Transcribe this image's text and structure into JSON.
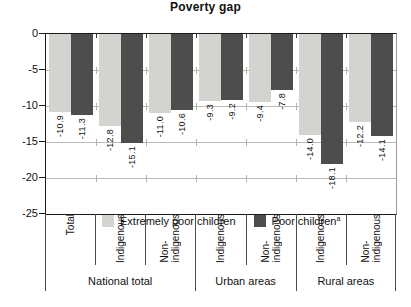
{
  "title": "Poverty gap",
  "legend": {
    "items": [
      {
        "label": "Extremely poor children",
        "superscript": "",
        "color": "#d3d3d0"
      },
      {
        "label": "Poor children",
        "superscript": "a",
        "color": "#4d4d4d"
      }
    ]
  },
  "y_axis": {
    "tick_labels": [
      "0",
      "-5",
      "-10",
      "-15",
      "-20",
      "-25"
    ]
  },
  "x_axis": {
    "groups": [
      {
        "label": "National total",
        "categories": [
          "Total",
          "Indigenous",
          "Non-\nindigenous"
        ]
      },
      {
        "label": "Urban areas",
        "categories": [
          "Indigenous",
          "Non-\nindigenous"
        ]
      },
      {
        "label": "Rural areas",
        "categories": [
          "Indigenous",
          "Non-\nindigenous"
        ]
      }
    ]
  },
  "chart_data": {
    "type": "bar",
    "title": "Poverty gap",
    "categories": [
      "National total - Total",
      "National total - Indigenous",
      "National total - Non-indigenous",
      "Urban areas - Indigenous",
      "Urban areas - Non-indigenous",
      "Rural areas - Indigenous",
      "Rural areas - Non-indigenous"
    ],
    "series": [
      {
        "name": "Extremely poor children",
        "color": "#d3d3d0",
        "values": [
          -10.9,
          -12.8,
          -11.0,
          -9.3,
          -9.4,
          -14.0,
          -12.2
        ],
        "labels": [
          "-10.9",
          "-12.8",
          "-11.0",
          "-9.3",
          "-9.4",
          "-14.0",
          "-12.2"
        ]
      },
      {
        "name": "Poor children",
        "color": "#4d4d4d",
        "values": [
          -11.3,
          -15.1,
          -10.6,
          -9.2,
          -7.8,
          -18.1,
          -14.1
        ],
        "labels": [
          "-11.3",
          "-15.1",
          "-10.6",
          "-9.2",
          "-7.8",
          "-18.1",
          "-14.1"
        ]
      }
    ],
    "ylim": [
      -25,
      0
    ],
    "y_ticks": [
      0,
      -5,
      -10,
      -15,
      -20,
      -25
    ],
    "grid": true,
    "legend_position": "inside-bottom-left",
    "value_labels": "rotated 90deg counterclockwise, placed below each bar end"
  }
}
